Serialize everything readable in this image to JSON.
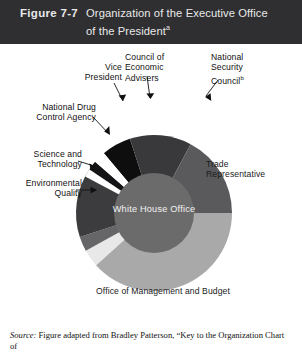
{
  "header": {
    "figure_number": "Figure 7-7",
    "title_line1": "Organization of the Executive Office",
    "title_line2": "of the President",
    "title_note": "a",
    "background_color": "#2f2f31",
    "text_color": "#e9e9ea"
  },
  "hub": {
    "label": "White House Office",
    "color": "#6b6b6b",
    "text_color": "#f2f2f2"
  },
  "callouts": {
    "vice_president": "Vice\nPresident",
    "vice_president_l1": "Vice",
    "vice_president_l2": "President",
    "council_economic_advisers_l1": "Council of Economic",
    "council_economic_advisers_l2": "Advisers",
    "national_security_council_l1": "National",
    "national_security_council_l2": "Security",
    "national_security_council_l3": "Council",
    "national_security_council_note": "b",
    "national_drug_control_l1": "National Drug",
    "national_drug_control_l2": "Control Agency",
    "science_technology_l1": "Science and",
    "science_technology_l2": "Technology",
    "environmental_quality_l1": "Environmental",
    "environmental_quality_l2": "Quality"
  },
  "inside_labels": {
    "trade_representative_l1": "Trade",
    "trade_representative_l2": "Representative",
    "office_management_budget": "Office of Management and Budget"
  },
  "source": {
    "prefix": "Source:",
    "text": " Figure adapted from Bradley Patterson, “Key to the Organization Chart of"
  },
  "chart_data": {
    "type": "pie",
    "title": "Organization of the Executive Office of the President",
    "variant": "donut",
    "center": [
      154,
      169
    ],
    "outer_radius": 78,
    "inner_radius": 40,
    "start_angle_deg": -90,
    "direction": "clockwise",
    "legend": "inline-callouts",
    "grid": false,
    "categories": [
      "Council of Economic Advisers",
      "National Security Council",
      "Trade Representative",
      "Office of Management and Budget",
      "Environmental Quality",
      "Science and Technology",
      "National Drug Control Agency",
      "Vice President"
    ],
    "values": [
      6,
      13,
      25,
      38,
      4,
      4,
      8,
      2
    ],
    "colors": [
      "#0e0e0e",
      "#39393b",
      "#5a5a5c",
      "#a9a9a9",
      "#e8e8e8",
      "#666668",
      "#3c3c3e",
      "#141416"
    ],
    "slices": [
      {
        "label": "Vice President",
        "value": 2,
        "start_deg": -56,
        "end_deg": -49,
        "color": "#141416"
      },
      {
        "label": "Council of Economic Advisers",
        "value": 6,
        "start_deg": -40,
        "end_deg": -18,
        "color": "#0e0e0e"
      },
      {
        "label": "National Security Council",
        "value": 13,
        "start_deg": -18,
        "end_deg": 28,
        "color": "#39393b"
      },
      {
        "label": "Trade Representative",
        "value": 25,
        "start_deg": 28,
        "end_deg": 90,
        "color": "#5a5a5c"
      },
      {
        "label": "Office of Management and Budget",
        "value": 38,
        "start_deg": 90,
        "end_deg": 228,
        "color": "#a9a9a9"
      },
      {
        "label": "Environmental Quality",
        "value": 4,
        "start_deg": 228,
        "end_deg": 241,
        "color": "#e8e8e8"
      },
      {
        "label": "Science and Technology",
        "value": 4,
        "start_deg": 241,
        "end_deg": 252,
        "color": "#666668"
      },
      {
        "label": "National Drug Control Agency",
        "value": 8,
        "start_deg": 252,
        "end_deg": 304,
        "color": "#3c3c3e"
      }
    ]
  }
}
